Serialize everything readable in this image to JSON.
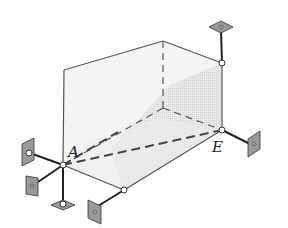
{
  "figure": {
    "labels": {
      "point_a": "A",
      "point_e": "E"
    },
    "colors": {
      "edge": "#555555",
      "shade": "#d9d9d9",
      "support_plate": "#9a9a9a",
      "link": "#222222"
    }
  }
}
